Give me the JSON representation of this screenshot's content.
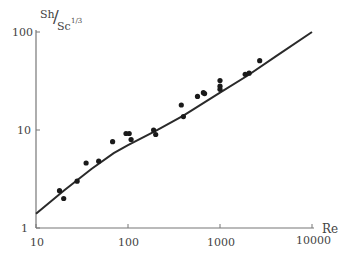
{
  "chart_data": {
    "type": "scatter",
    "title": "",
    "xlabel": "Re",
    "ylabel": "Sh/Sc^1/3",
    "ylabel_num": "Sh",
    "ylabel_den": "Sc",
    "ylabel_exp": "1/3",
    "xscale": "log",
    "yscale": "log",
    "xlim": [
      10,
      10000
    ],
    "ylim": [
      1,
      100
    ],
    "x_ticks": [
      "10",
      "100",
      "1000",
      "10000"
    ],
    "y_ticks": [
      "1",
      "10",
      "100"
    ],
    "grid": false,
    "legend": null,
    "series": [
      {
        "name": "measured",
        "kind": "points",
        "x": [
          18,
          20,
          28,
          35,
          48,
          68,
          95,
          103,
          108,
          190,
          200,
          380,
          400,
          570,
          660,
          680,
          1000,
          1000,
          1000,
          1880,
          2070,
          2700
        ],
        "y": [
          2.4,
          2.0,
          3.0,
          4.6,
          4.8,
          7.6,
          9.2,
          9.2,
          8.0,
          10.0,
          9.0,
          18.0,
          13.7,
          22.0,
          24.0,
          23.5,
          32.0,
          28.0,
          26.0,
          37.0,
          38.0,
          51.0
        ]
      },
      {
        "name": "correlation",
        "kind": "line",
        "x": [
          10,
          20,
          40,
          70,
          100,
          200,
          400,
          1000,
          2000,
          4000,
          10000
        ],
        "y": [
          1.4,
          2.4,
          4.0,
          5.8,
          7.0,
          9.8,
          14.0,
          24.0,
          36.0,
          56.0,
          100.0
        ]
      }
    ]
  }
}
